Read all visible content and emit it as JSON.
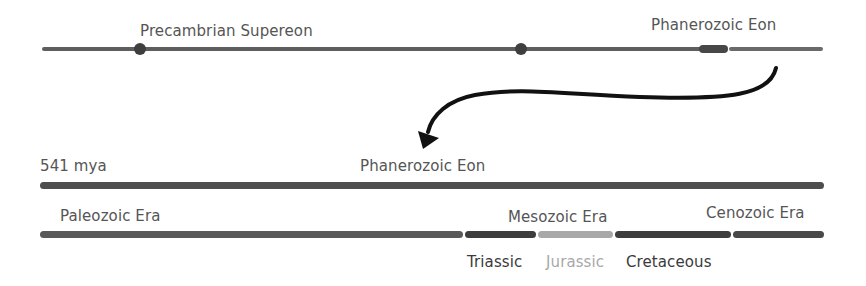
{
  "top_timeline": {
    "left_label": "Precambrian Supereon",
    "right_label": "Phanerozoic Eon"
  },
  "phanerozoic_timeline": {
    "start_label": "541 mya",
    "title": "Phanerozoic Eon"
  },
  "eras": [
    {
      "name": "Paleozoic Era",
      "color": "#555555"
    },
    {
      "name": "Mesozoic Era",
      "color": "#3c3c3c"
    },
    {
      "name": "Cenozoic Era",
      "color": "#4a4a4a"
    }
  ],
  "periods": [
    {
      "name": "Triassic",
      "color": "#3d3d3d"
    },
    {
      "name": "Jurassic",
      "color": "#a8a8a8"
    },
    {
      "name": "Cretaceous",
      "color": "#3d3d3d"
    }
  ],
  "colors": {
    "line": "#5a5a5a",
    "dark_line": "#444444",
    "arrow": "#111111"
  }
}
